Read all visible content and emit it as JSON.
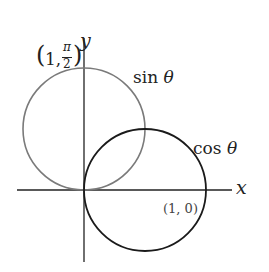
{
  "axes": {
    "x_label": "x",
    "y_label": "y"
  },
  "curves": [
    {
      "name": "sin θ",
      "label": "sin θ",
      "color": "#7a7a7a"
    },
    {
      "name": "cos θ",
      "label": "cos θ",
      "color": "#1a1a1a"
    }
  ],
  "points": [
    {
      "label": "(1, π/2)",
      "text_open": "(",
      "text_one": "1,",
      "pi": "π",
      "two": "2",
      "text_close": ")"
    },
    {
      "label": "(1, 0)"
    }
  ],
  "labels": {
    "sin_prefix": "sin ",
    "cos_prefix": "cos ",
    "theta": "θ"
  }
}
